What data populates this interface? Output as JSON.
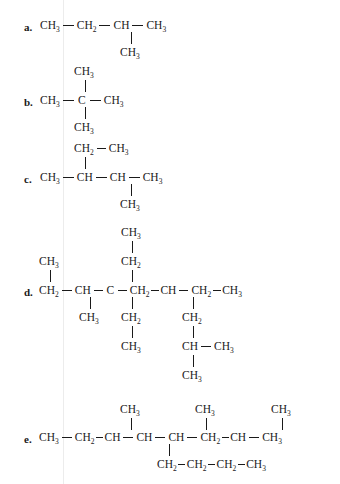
{
  "page": {
    "background_color": "#ffffff",
    "text_color": "#1a1a1a",
    "rule_color": "#ececec"
  },
  "groups": {
    "ch3": "CH",
    "ch3_sub": "3",
    "ch2": "CH",
    "ch2_sub": "2",
    "ch": "CH",
    "c": "C"
  },
  "items": [
    {
      "label": "a.",
      "main_chain": [
        "CH3",
        "CH2",
        "CH",
        "CH3"
      ],
      "branches": [
        {
          "attached_to_index": 2,
          "direction": "down",
          "chain": [
            "CH3"
          ]
        }
      ]
    },
    {
      "label": "b.",
      "main_chain": [
        "CH3",
        "C",
        "CH3"
      ],
      "branches": [
        {
          "attached_to_index": 1,
          "direction": "up",
          "chain": [
            "CH3"
          ]
        },
        {
          "attached_to_index": 1,
          "direction": "down",
          "chain": [
            "CH3"
          ]
        }
      ]
    },
    {
      "label": "c.",
      "main_chain": [
        "CH3",
        "CH",
        "CH",
        "CH3"
      ],
      "branches": [
        {
          "attached_to_index": 1,
          "direction": "up",
          "chain": [
            "CH2",
            "CH3"
          ]
        },
        {
          "attached_to_index": 2,
          "direction": "down",
          "chain": [
            "CH3"
          ]
        }
      ]
    },
    {
      "label": "d.",
      "main_chain": [
        "CH2",
        "CH",
        "C",
        "CH2",
        "CH",
        "CH2",
        "CH3"
      ],
      "branches": [
        {
          "attached_to_index": 0,
          "direction": "up",
          "chain": [
            "CH3"
          ]
        },
        {
          "attached_to_index": 1,
          "direction": "down",
          "chain": [
            "CH3"
          ]
        },
        {
          "attached_to_index": 2,
          "direction": "up",
          "chain": [
            "CH2",
            "CH3"
          ]
        },
        {
          "attached_to_index": 2,
          "direction": "down",
          "chain": [
            "CH2",
            "CH3"
          ]
        },
        {
          "attached_to_index": 4,
          "direction": "down",
          "chain": [
            "CH2",
            "CH",
            "CH3"
          ]
        }
      ]
    },
    {
      "label": "e.",
      "main_chain": [
        "CH3",
        "CH2",
        "CH",
        "CH",
        "CH",
        "CH2",
        "CH",
        "CH3"
      ],
      "branches": [
        {
          "attached_to_index": 2,
          "direction": "up",
          "chain": [
            "CH3"
          ]
        },
        {
          "attached_to_index": 4,
          "direction": "up",
          "chain": [
            "CH3"
          ]
        },
        {
          "attached_to_index": 6,
          "direction": "up",
          "chain": [
            "CH3"
          ]
        },
        {
          "attached_to_index": 3,
          "direction": "down",
          "chain": [
            "CH2",
            "CH2",
            "CH2",
            "CH3"
          ]
        }
      ]
    }
  ],
  "labels": {
    "a": "a.",
    "b": "b.",
    "c": "c.",
    "d": "d.",
    "e": "e."
  },
  "text": {
    "ch3": "CH3",
    "ch2": "CH2",
    "ch": "CH",
    "c": "C"
  }
}
